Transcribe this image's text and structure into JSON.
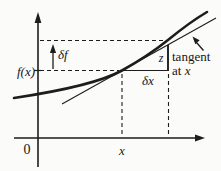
{
  "figure": {
    "kind": "calculus tangent-line increment diagram",
    "labels": {
      "origin": "0",
      "x_tick": "x",
      "f_of_x": "f(x)",
      "delta_f": "δf",
      "delta_x": "δx",
      "z": "z",
      "tangent_word": "tangent",
      "at_word": "at ",
      "at_var": "x"
    },
    "colors": {
      "ink": "#1d1d1d",
      "background": "#fbfbf9"
    }
  }
}
